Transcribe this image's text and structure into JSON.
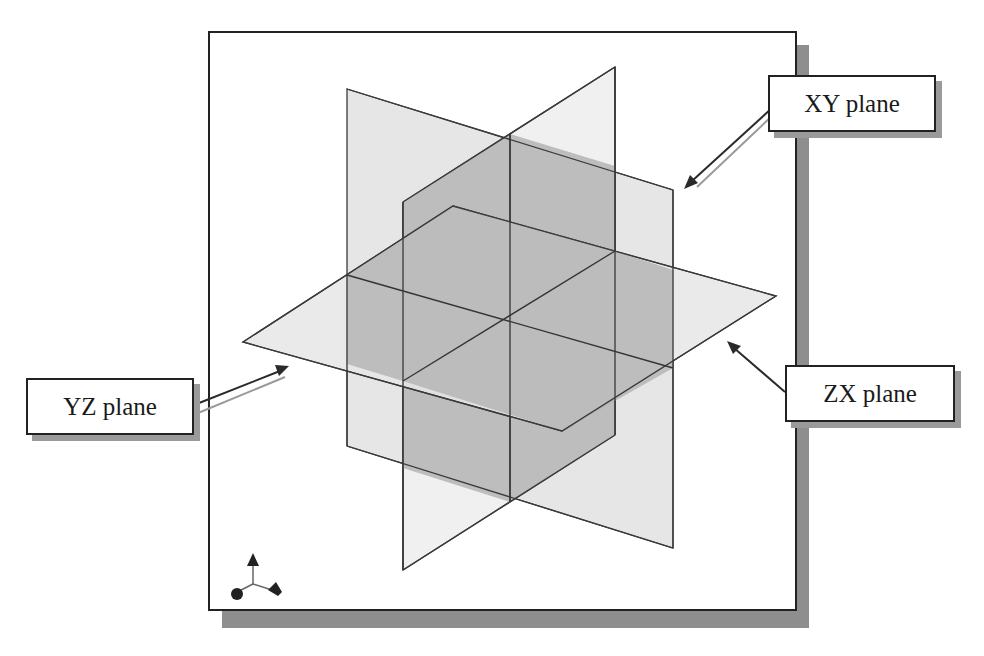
{
  "figure": {
    "colors": {
      "frame_border": "#222222",
      "frame_shadow": "#8c8c8c",
      "plane_light": "#e2e2e2",
      "plane_dark": "#b9b9b9",
      "edge": "#333333",
      "arrow_dark": "#2a2a2a",
      "arrow_light": "#9a9a9a"
    }
  },
  "labels": {
    "xy": "XY plane",
    "yz": "YZ plane",
    "zx": "ZX plane"
  },
  "triad": {
    "icon": "axis-triad-icon"
  }
}
